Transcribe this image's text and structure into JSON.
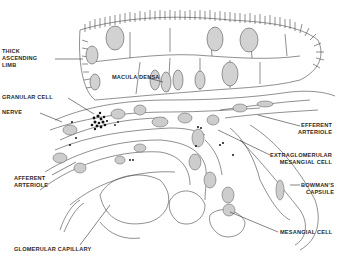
{
  "figure": {
    "colors": {
      "background": "#ffffff",
      "ink": "#333333",
      "nucleus_fill": "#cfcfcf",
      "granule": "#111111"
    }
  },
  "labels": {
    "thick_ascending_limb": "THICK\nASCENDING\nLIMB",
    "macula_densa": "MACULA DENSA",
    "granular_cell": "GRANULAR CELL",
    "nerve": "NERVE",
    "efferent_arteriole": "EFFERENT\nARTERIOLE",
    "extraglomerular_mesangial_cell": "EXTRAGLOMERULAR\nMESANGIAL CELL",
    "bowmans_capsule": "BOWMAN'S\nCAPSULE",
    "afferent_arteriole": "AFFERENT\nARTERIOLE",
    "mesangial_cell": "MESANGIAL CELL",
    "glomerular_capillary": "GLOMERULAR CAPILLARY"
  }
}
